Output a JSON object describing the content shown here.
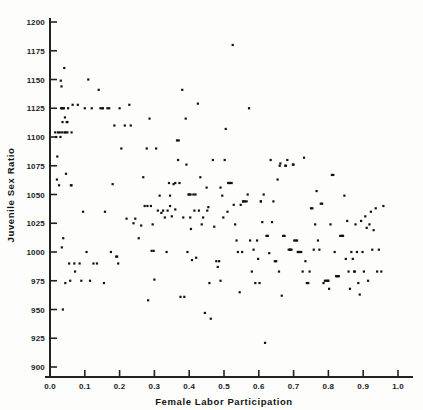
{
  "figure": {
    "background_color": "#fdfdfc",
    "ink_color": "#141414",
    "point_color": "#111111"
  },
  "axes": {
    "x_title": "Female Labor Participation",
    "y_title": "Juvenile Sex Ratio",
    "x_ticks": [
      "0.0",
      "0.1",
      "0.2",
      "0.3",
      "0.4",
      "0.5",
      "0.6",
      "0.7",
      "0.8",
      "0.9",
      "1.0"
    ],
    "y_ticks": [
      "900",
      "925",
      "950",
      "975",
      "1000",
      "1025",
      "1050",
      "1075",
      "1100",
      "1125",
      "1150",
      "1175",
      "1200"
    ]
  },
  "chart_data": {
    "type": "scatter",
    "title": "",
    "xlabel": "Female Labor Participation",
    "ylabel": "Juvenile Sex Ratio",
    "xlim": [
      0.0,
      1.0
    ],
    "ylim": [
      900,
      1200
    ],
    "xtick_step": 0.1,
    "ytick_step": 25,
    "grid": false,
    "legend": false,
    "marker": "square",
    "marker_size_px": 2.2,
    "series": [
      {
        "name": "districts",
        "points": [
          [
            0.015,
            1104
          ],
          [
            0.018,
            1100
          ],
          [
            0.02,
            1063
          ],
          [
            0.021,
            1083
          ],
          [
            0.023,
            1104
          ],
          [
            0.026,
            1058
          ],
          [
            0.028,
            1104
          ],
          [
            0.03,
            1100
          ],
          [
            0.031,
            1149
          ],
          [
            0.032,
            1125
          ],
          [
            0.033,
            1144
          ],
          [
            0.034,
            1004
          ],
          [
            0.035,
            1104
          ],
          [
            0.036,
            1125
          ],
          [
            0.036,
            1113
          ],
          [
            0.037,
            950
          ],
          [
            0.038,
            1012
          ],
          [
            0.04,
            1125
          ],
          [
            0.041,
            1160
          ],
          [
            0.042,
            1104
          ],
          [
            0.043,
            1117
          ],
          [
            0.044,
            973
          ],
          [
            0.045,
            1104
          ],
          [
            0.046,
            1068
          ],
          [
            0.048,
            1113
          ],
          [
            0.05,
            1104
          ],
          [
            0.052,
            1125
          ],
          [
            0.055,
            990
          ],
          [
            0.058,
            975
          ],
          [
            0.06,
            1058
          ],
          [
            0.062,
            1104
          ],
          [
            0.065,
            1128
          ],
          [
            0.07,
            990
          ],
          [
            0.072,
            983
          ],
          [
            0.08,
            1128
          ],
          [
            0.085,
            990
          ],
          [
            0.09,
            975
          ],
          [
            0.095,
            1035
          ],
          [
            0.1,
            1125
          ],
          [
            0.105,
            1000
          ],
          [
            0.11,
            1150
          ],
          [
            0.115,
            975
          ],
          [
            0.12,
            1125
          ],
          [
            0.125,
            990
          ],
          [
            0.135,
            990
          ],
          [
            0.14,
            1141
          ],
          [
            0.145,
            1125
          ],
          [
            0.15,
            1125
          ],
          [
            0.152,
            1125
          ],
          [
            0.155,
            973
          ],
          [
            0.158,
            1035
          ],
          [
            0.165,
            1125
          ],
          [
            0.17,
            1125
          ],
          [
            0.175,
            1000
          ],
          [
            0.18,
            1059
          ],
          [
            0.185,
            1110
          ],
          [
            0.19,
            996
          ],
          [
            0.193,
            996
          ],
          [
            0.196,
            990
          ],
          [
            0.2,
            1125
          ],
          [
            0.205,
            1090
          ],
          [
            0.215,
            1110
          ],
          [
            0.22,
            1029
          ],
          [
            0.228,
            1128
          ],
          [
            0.232,
            1110
          ],
          [
            0.24,
            1025
          ],
          [
            0.245,
            1029
          ],
          [
            0.255,
            1012
          ],
          [
            0.262,
            1023
          ],
          [
            0.268,
            1065
          ],
          [
            0.272,
            1040
          ],
          [
            0.278,
            1090
          ],
          [
            0.282,
            958
          ],
          [
            0.286,
            1116
          ],
          [
            0.29,
            1040
          ],
          [
            0.292,
            1001
          ],
          [
            0.295,
            1024
          ],
          [
            0.298,
            1001
          ],
          [
            0.3,
            976
          ],
          [
            0.305,
            1090
          ],
          [
            0.31,
            1036
          ],
          [
            0.315,
            1049
          ],
          [
            0.32,
            1034
          ],
          [
            0.325,
            1036
          ],
          [
            0.33,
            1030
          ],
          [
            0.335,
            1000
          ],
          [
            0.338,
            1036
          ],
          [
            0.342,
            1060
          ],
          [
            0.345,
            1040
          ],
          [
            0.35,
            1031
          ],
          [
            0.355,
            1059
          ],
          [
            0.36,
            1037
          ],
          [
            0.365,
            1097
          ],
          [
            0.368,
            1080
          ],
          [
            0.37,
            1097
          ],
          [
            0.372,
            1060
          ],
          [
            0.375,
            961
          ],
          [
            0.38,
            1141
          ],
          [
            0.383,
            1030
          ],
          [
            0.386,
            961
          ],
          [
            0.39,
            1116
          ],
          [
            0.392,
            1076
          ],
          [
            0.395,
            1000
          ],
          [
            0.398,
            1050
          ],
          [
            0.4,
            1050
          ],
          [
            0.403,
            1030
          ],
          [
            0.405,
            1020
          ],
          [
            0.408,
            993
          ],
          [
            0.412,
            1050
          ],
          [
            0.415,
            1036
          ],
          [
            0.418,
            1050
          ],
          [
            0.42,
            995
          ],
          [
            0.425,
            1129
          ],
          [
            0.428,
            1036
          ],
          [
            0.432,
            1065
          ],
          [
            0.436,
            1024
          ],
          [
            0.44,
            1030
          ],
          [
            0.445,
            947
          ],
          [
            0.45,
            1056
          ],
          [
            0.452,
            1036
          ],
          [
            0.455,
            1039
          ],
          [
            0.458,
            973
          ],
          [
            0.462,
            942
          ],
          [
            0.468,
            1080
          ],
          [
            0.472,
            1022
          ],
          [
            0.478,
            992
          ],
          [
            0.482,
            987
          ],
          [
            0.486,
            992
          ],
          [
            0.49,
            975
          ],
          [
            0.495,
            1049
          ],
          [
            0.498,
            1030
          ],
          [
            0.502,
            1080
          ],
          [
            0.505,
            1107
          ],
          [
            0.51,
            1035
          ],
          [
            0.515,
            1060
          ],
          [
            0.518,
            1060
          ],
          [
            0.522,
            1060
          ],
          [
            0.525,
            1180
          ],
          [
            0.528,
            1041
          ],
          [
            0.532,
            1024
          ],
          [
            0.536,
            1010
          ],
          [
            0.54,
            1000
          ],
          [
            0.545,
            965
          ],
          [
            0.548,
            1041
          ],
          [
            0.552,
            1000
          ],
          [
            0.556,
            1044
          ],
          [
            0.56,
            1044
          ],
          [
            0.565,
            1044
          ],
          [
            0.568,
            1050
          ],
          [
            0.572,
            1125
          ],
          [
            0.575,
            1010
          ],
          [
            0.58,
            983
          ],
          [
            0.585,
            1002
          ],
          [
            0.59,
            973
          ],
          [
            0.595,
            1010
          ],
          [
            0.598,
            994
          ],
          [
            0.602,
            973
          ],
          [
            0.606,
            1044
          ],
          [
            0.61,
            1026
          ],
          [
            0.614,
            1050
          ],
          [
            0.618,
            921
          ],
          [
            0.622,
            1014
          ],
          [
            0.626,
            1014
          ],
          [
            0.63,
            999
          ],
          [
            0.634,
            1080
          ],
          [
            0.638,
            1026
          ],
          [
            0.642,
            1044
          ],
          [
            0.646,
            992
          ],
          [
            0.65,
            992
          ],
          [
            0.654,
            1063
          ],
          [
            0.658,
            983
          ],
          [
            0.662,
            1077
          ],
          [
            0.666,
            962
          ],
          [
            0.67,
            1014
          ],
          [
            0.674,
            1014
          ],
          [
            0.678,
            1075
          ],
          [
            0.682,
            1080
          ],
          [
            0.686,
            1002
          ],
          [
            0.69,
            1002
          ],
          [
            0.694,
            1002
          ],
          [
            0.698,
            1076
          ],
          [
            0.7,
            1076
          ],
          [
            0.702,
            1010
          ],
          [
            0.706,
            1010
          ],
          [
            0.71,
            1010
          ],
          [
            0.714,
            1000
          ],
          [
            0.718,
            1000
          ],
          [
            0.722,
            1000
          ],
          [
            0.726,
            983
          ],
          [
            0.73,
            1082
          ],
          [
            0.734,
            992
          ],
          [
            0.738,
            973
          ],
          [
            0.742,
            973
          ],
          [
            0.746,
            983
          ],
          [
            0.75,
            1038
          ],
          [
            0.754,
            1038
          ],
          [
            0.758,
            1002
          ],
          [
            0.762,
            1024
          ],
          [
            0.766,
            1053
          ],
          [
            0.77,
            1010
          ],
          [
            0.774,
            1002
          ],
          [
            0.778,
            1042
          ],
          [
            0.782,
            1042
          ],
          [
            0.786,
            973
          ],
          [
            0.79,
            975
          ],
          [
            0.794,
            975
          ],
          [
            0.798,
            975
          ],
          [
            0.802,
            968
          ],
          [
            0.806,
            1024
          ],
          [
            0.81,
            1067
          ],
          [
            0.814,
            1067
          ],
          [
            0.818,
            1000
          ],
          [
            0.822,
            979
          ],
          [
            0.826,
            979
          ],
          [
            0.83,
            979
          ],
          [
            0.834,
            1014
          ],
          [
            0.838,
            1014
          ],
          [
            0.842,
            1014
          ],
          [
            0.846,
            1049
          ],
          [
            0.85,
            994
          ],
          [
            0.854,
            1027
          ],
          [
            0.858,
            983
          ],
          [
            0.862,
            968
          ],
          [
            0.866,
            1000
          ],
          [
            0.87,
            994
          ],
          [
            0.874,
            983
          ],
          [
            0.878,
            1024
          ],
          [
            0.882,
            1000
          ],
          [
            0.886,
            973
          ],
          [
            0.89,
            963
          ],
          [
            0.894,
            1027
          ],
          [
            0.898,
            1000
          ],
          [
            0.902,
            983
          ],
          [
            0.906,
            1031
          ],
          [
            0.91,
            1021
          ],
          [
            0.914,
            975
          ],
          [
            0.918,
            1024
          ],
          [
            0.922,
            1035
          ],
          [
            0.926,
            1002
          ],
          [
            0.93,
            1019
          ],
          [
            0.936,
            1038
          ],
          [
            0.94,
            983
          ],
          [
            0.945,
            1002
          ],
          [
            0.952,
            983
          ],
          [
            0.958,
            1040
          ],
          [
            0.035,
            1125
          ],
          [
            0.05,
            1113
          ],
          [
            0.062,
            1058
          ],
          [
            0.28,
            1040
          ],
          [
            0.345,
            1049
          ],
          [
            0.36,
            1060
          ],
          [
            0.404,
            1050
          ],
          [
            0.49,
            1056
          ],
          [
            0.512,
            1060
          ],
          [
            0.555,
            1044
          ],
          [
            0.606,
            1044
          ],
          [
            0.66,
            1075
          ],
          [
            0.676,
            1075
          ],
          [
            0.69,
            1002
          ],
          [
            0.712,
            1000
          ],
          [
            0.8,
            975
          ],
          [
            0.826,
            979
          ],
          [
            0.84,
            1014
          ],
          [
            0.876,
            983
          ]
        ]
      }
    ]
  }
}
